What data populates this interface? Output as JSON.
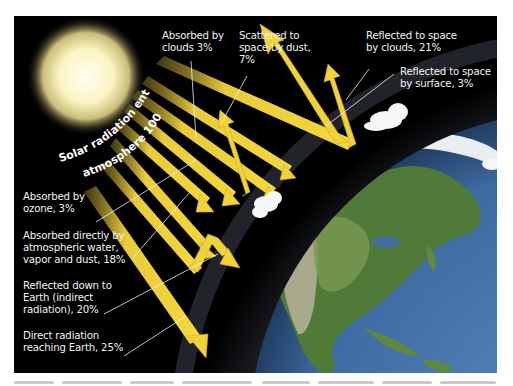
{
  "diagram": {
    "type": "solar-radiation-budget",
    "title_arc": {
      "line1": "Solar radiation entering",
      "line2": "atmosphere 100%"
    },
    "labels": {
      "absorbed_clouds": [
        "Absorbed by",
        "clouds 3%"
      ],
      "scattered_dust": [
        "Scattered to",
        "space by dust,",
        "7%"
      ],
      "reflected_clouds": [
        "Reflected to space",
        "by clouds, 21%"
      ],
      "reflected_surface": [
        "Reflected to space",
        "by surface, 3%"
      ],
      "absorbed_ozone": [
        "Absorbed by",
        "ozone, 3%"
      ],
      "absorbed_water": [
        "Absorbed directly by",
        "atmospheric water,",
        "vapor and dust, 18%"
      ],
      "reflected_down": [
        "Reflected down to",
        "Earth (indirect",
        "radiation), 20%"
      ],
      "direct_radiation": [
        "Direct radiation",
        "reaching Earth, 25%"
      ]
    },
    "percentages": {
      "entering": 100,
      "absorbed_by_clouds": 3,
      "scattered_by_dust": 7,
      "reflected_by_clouds": 21,
      "reflected_by_surface": 3,
      "absorbed_by_ozone": 3,
      "absorbed_by_water_vapor_dust": 18,
      "reflected_down_indirect": 20,
      "direct_reaching_earth": 25
    },
    "colors": {
      "arrow": "#f2d23a",
      "arrow_shade": "#c9a82a",
      "space": "#000000",
      "sun_core": "#fffbe0",
      "sun_glow": "#f5ea9c",
      "atmosphere_outer": "#2a3140",
      "atmosphere_inner": "#9fc1dc",
      "ocean": "#3f6fa8",
      "land": "#4f7a38",
      "text": "#f2f2f2"
    }
  }
}
